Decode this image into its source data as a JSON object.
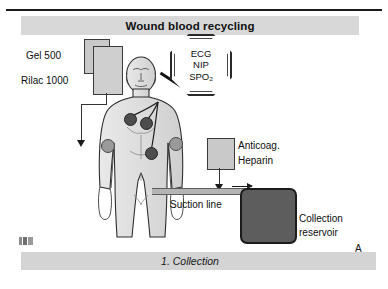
{
  "figure": {
    "title": "Wound blood recycling",
    "caption": "1. Collection",
    "panel_letter": "A",
    "artist_mark": "",
    "background_color": "#ffffff",
    "title_band_color": "#d8d8d8",
    "caption_band_color": "#d4d4d4",
    "reservoir_color": "#5d5d5d",
    "bag_color": "#c9c9c9",
    "line_color": "#1a1a1a"
  },
  "labels": {
    "gel": "Gel 500",
    "rilac": "Rilac 1000",
    "anticoagulant_line1": "Anticoag.",
    "anticoagulant_line2": "Heparin",
    "suction_line": "Suction line",
    "reservoir_line1": "Collection",
    "reservoir_line2": "reservoir"
  },
  "monitor": {
    "name": "patient-monitor",
    "shape": "octagon",
    "lines": [
      "ECG",
      "NIP",
      "SPO₂"
    ]
  },
  "icons": {
    "iv_bag": "iv-bag-icon",
    "monitor": "monitor-octagon-icon",
    "patient": "patient-body-icon",
    "reservoir": "collection-reservoir-icon",
    "anticoagulant": "anticoagulant-bag-icon",
    "flow_arrow": "flow-arrow-icon",
    "artist_mark": "artist-signature-icon"
  }
}
